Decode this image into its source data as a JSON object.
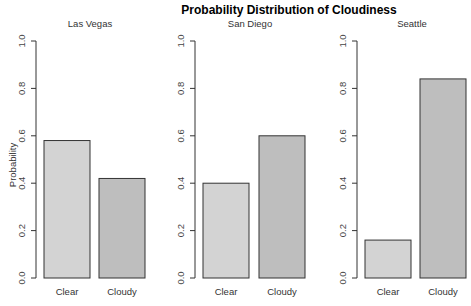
{
  "chart_data": {
    "type": "bar",
    "title": "Probability Distribution of Cloudiness",
    "ylabel": "Probability",
    "xlabel": "",
    "ylim": [
      0,
      1
    ],
    "yticks": [
      "0.0",
      "0.2",
      "0.4",
      "0.6",
      "0.8",
      "1.0"
    ],
    "ytick_values": [
      0,
      0.2,
      0.4,
      0.6,
      0.8,
      1.0
    ],
    "categories": [
      "Clear",
      "Cloudy"
    ],
    "colors": {
      "Clear": "#d3d3d3",
      "Cloudy": "#bebebe"
    },
    "grid": false,
    "legend": "none",
    "panels": [
      {
        "name": "Las Vegas",
        "values": [
          0.58,
          0.42
        ]
      },
      {
        "name": "San Diego",
        "values": [
          0.4,
          0.6
        ]
      },
      {
        "name": "Seattle",
        "values": [
          0.16,
          0.84
        ]
      }
    ]
  }
}
